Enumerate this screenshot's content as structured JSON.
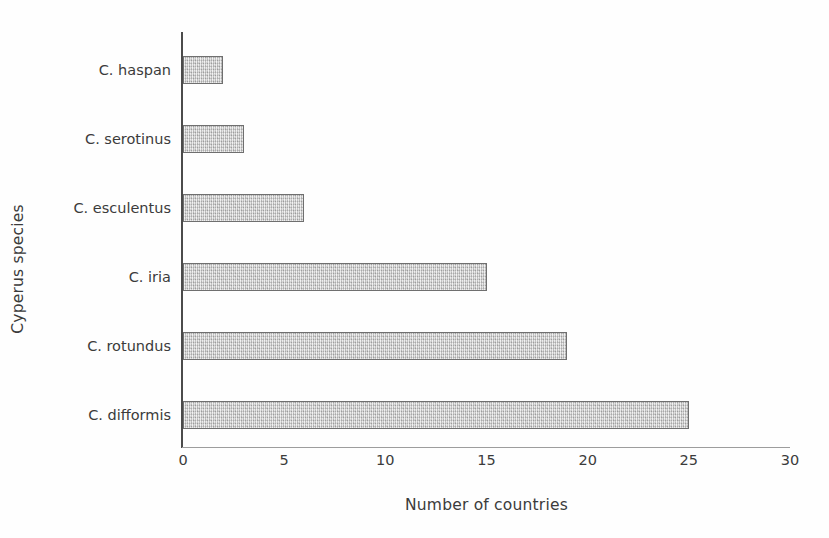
{
  "chart_data": {
    "type": "bar",
    "orientation": "horizontal",
    "title": "",
    "xlabel": "Number of countries",
    "ylabel": "Cyperus species",
    "categories": [
      "C. difformis",
      "C. rotundus",
      "C. iria",
      "C. esculentus",
      "C. serotinus",
      "C. haspan"
    ],
    "values": [
      25,
      19,
      15,
      6,
      3,
      2
    ],
    "xlim": [
      0,
      30
    ],
    "xticks": [
      0,
      5,
      10,
      15,
      20,
      25,
      30
    ],
    "xtick_labels": [
      "0",
      "5",
      "10",
      "15",
      "20",
      "25",
      "30"
    ],
    "grid": false,
    "legend": false,
    "bar_fill_color": "#c9c9c9",
    "bar_border_color": "#6f6f6f",
    "axis_color": "#4b4b4b",
    "text_color": "#3b3b3b",
    "background_color": "#fefefe"
  }
}
